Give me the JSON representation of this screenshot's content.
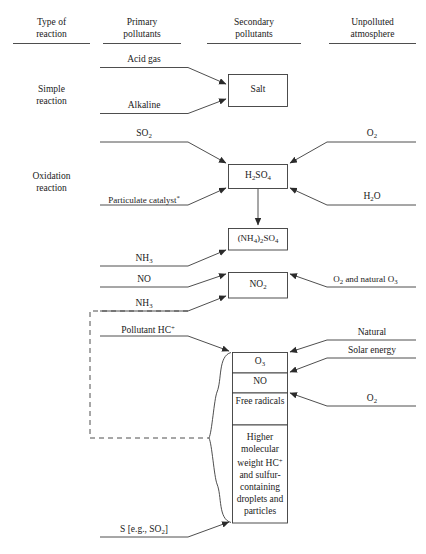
{
  "diagram": {
    "headers": [
      {
        "id": "type-of-reaction",
        "line1": "Type of",
        "line2": "reaction"
      },
      {
        "id": "primary-pollutants",
        "line1": "Primary",
        "line2": "pollutants"
      },
      {
        "id": "secondary-pollutants",
        "line1": "Secondary",
        "line2": "pollutants"
      },
      {
        "id": "unpolluted-atmosphere",
        "line1": "Unpolluted",
        "line2": "atmosphere"
      }
    ],
    "row_labels": [
      {
        "id": "simple-reaction",
        "line1": "Simple",
        "line2": "reaction"
      },
      {
        "id": "oxidation-reaction",
        "line1": "Oxidation",
        "line2": "reaction"
      }
    ],
    "primary_inputs": [
      {
        "id": "acid-gas",
        "text": "Acid gas"
      },
      {
        "id": "alkaline",
        "text": "Alkaline"
      },
      {
        "id": "so2",
        "text": "SO2",
        "html": "SO<sub>2</sub>"
      },
      {
        "id": "particulate-catalyst",
        "text": "Particulate catalyst*",
        "html": "Particulate catalyst<sup>*</sup>"
      },
      {
        "id": "nh3-ammonium-sulfate",
        "text": "NH3",
        "html": "NH<sub>3</sub>"
      },
      {
        "id": "no",
        "text": "NO"
      },
      {
        "id": "nh3-lower",
        "text": "NH3",
        "html": "NH<sub>3</sub>"
      },
      {
        "id": "pollutant-hc",
        "text": "Pollutant HC+",
        "html": "Pollutant HC<sup>+</sup>"
      },
      {
        "id": "sulfur-source",
        "text": "S [e.g., SO2]",
        "html": "S [e.g., SO<sub>2</sub>]"
      }
    ],
    "atmosphere_inputs": [
      {
        "id": "o2-oxidation",
        "text": "O2",
        "html": "O<sub>2</sub>"
      },
      {
        "id": "h2o",
        "text": "H2O",
        "html": "H<sub>2</sub>O"
      },
      {
        "id": "o2-and-natural-o3",
        "text": "O2 and natural O3",
        "html": "O<sub>2</sub> and natural O<sub>3</sub>"
      },
      {
        "id": "natural",
        "text": "Natural"
      },
      {
        "id": "solar-energy",
        "text": "Solar energy"
      },
      {
        "id": "o2-photochemical",
        "text": "O2",
        "html": "O<sub>2</sub>"
      }
    ],
    "product_boxes": [
      {
        "id": "salt",
        "text": "Salt"
      },
      {
        "id": "h2so4",
        "text": "H2SO4",
        "html": "H<sub>2</sub>SO<sub>4</sub>"
      },
      {
        "id": "ammonium-sulfate",
        "text": "(NH4)2SO4",
        "html": "(NH<sub>4</sub>)<sub>2</sub>SO<sub>4</sub>"
      },
      {
        "id": "no2",
        "text": "NO2",
        "html": "NO<sub>2</sub>"
      },
      {
        "id": "o3",
        "text": "O3",
        "html": "O<sub>3</sub>"
      },
      {
        "id": "no-product",
        "text": "NO"
      },
      {
        "id": "free-radicals",
        "text": "Free radicals"
      },
      {
        "id": "higher-molecular-weight",
        "text": "Higher molecular weight HC+ and sulfur-containing droplets and particles",
        "html": "Higher molecular weight HC<sup>+</sup> and sulfur-containing droplets and particles"
      }
    ],
    "colors": {
      "stroke": "#3a3a3a",
      "text": "#1a1a1a",
      "background": "#ffffff"
    }
  }
}
